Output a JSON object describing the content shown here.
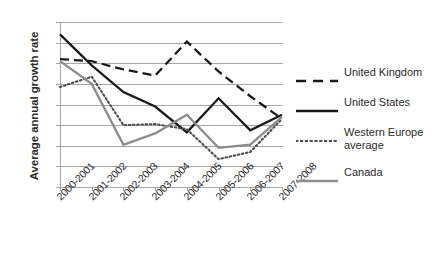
{
  "chart_data": {
    "type": "line",
    "title": "",
    "xlabel": "",
    "ylabel": "Average annual growth rate",
    "ylim": [
      0,
      8
    ],
    "yticks": [
      0,
      1,
      2,
      3,
      4,
      5,
      6,
      7,
      8
    ],
    "grid": true,
    "legend_position": "right",
    "categories": [
      "2000-2001",
      "2001-2002",
      "2002-2003",
      "2003-2004",
      "2004-2005",
      "2005-2006",
      "2006-2007",
      "2007-2008"
    ],
    "series": [
      {
        "name": "United Kingdom",
        "style": "dashed",
        "color": "#1a1a1a",
        "values": [
          6.2,
          6.1,
          5.7,
          5.4,
          7.05,
          5.6,
          4.4,
          3.3
        ]
      },
      {
        "name": "United States",
        "style": "solid",
        "color": "#1a1a1a",
        "values": [
          7.4,
          5.9,
          4.6,
          3.9,
          2.65,
          4.3,
          2.75,
          3.5
        ]
      },
      {
        "name": "Western Europe average",
        "style": "dotted",
        "color": "#4d4d4d",
        "values": [
          4.85,
          5.35,
          3.0,
          3.05,
          2.8,
          1.35,
          1.7,
          3.3
        ]
      },
      {
        "name": "Canada",
        "style": "solid",
        "color": "#8c8c8c",
        "values": [
          6.1,
          5.0,
          2.05,
          2.6,
          3.5,
          1.9,
          2.05,
          3.4
        ]
      }
    ]
  },
  "axis": {
    "y_title": "Average annual growth rate",
    "y_tick_labels": [
      "8",
      "7",
      "6",
      "5",
      "4",
      "3",
      "2",
      "1",
      "0"
    ],
    "x_tick_labels": [
      "2000-2001",
      "2001-2002",
      "2002-2003",
      "2003-2004",
      "2004-2005",
      "2005-2006",
      "2006-2007",
      "2007-2008"
    ]
  },
  "legend": {
    "items": [
      {
        "label": "United Kingdom",
        "swatch": "dashed-black-line-swatch"
      },
      {
        "label": "United States",
        "swatch": "solid-black-line-swatch"
      },
      {
        "label": "Western Europe average",
        "swatch": "dotted-gray-line-swatch"
      },
      {
        "label": "Canada",
        "swatch": "solid-gray-line-swatch"
      }
    ]
  },
  "colors": {
    "grid": "#a6a6a6",
    "text": "#2b2b2b",
    "uk": "#1a1a1a",
    "us": "#1a1a1a",
    "western_europe": "#4d4d4d",
    "canada": "#8c8c8c"
  }
}
